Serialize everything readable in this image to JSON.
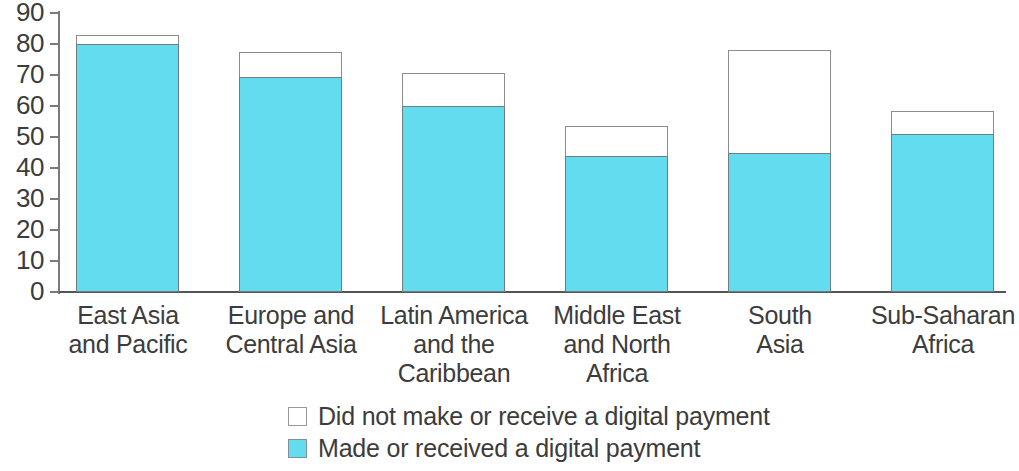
{
  "chart_data": {
    "type": "bar",
    "title": "",
    "subtitle": "",
    "xlabel": "",
    "ylabel": "",
    "ylim": [
      0,
      90
    ],
    "ytick_labels": [
      "90",
      "80",
      "70",
      "60",
      "50",
      "40",
      "30",
      "20",
      "10",
      "0"
    ],
    "yticks": [
      90,
      80,
      70,
      60,
      50,
      40,
      30,
      20,
      10,
      0
    ],
    "grid": false,
    "stacked": true,
    "legend_position": "bottom-center",
    "categories": [
      "East Asia and Pacific",
      "Europe and Central Asia",
      "Latin America and the Caribbean",
      "Middle East and North Africa",
      "South Asia",
      "Sub-Saharan Africa"
    ],
    "category_lines": [
      [
        "East Asia",
        "and Pacific"
      ],
      [
        "Europe and",
        "Central Asia"
      ],
      [
        "Latin America",
        "and the",
        "Caribbean"
      ],
      [
        "Middle East",
        "and North",
        "Africa"
      ],
      [
        "South",
        "Asia"
      ],
      [
        "Sub-Saharan",
        "Africa"
      ]
    ],
    "series": [
      {
        "name": "Made or received a digital payment",
        "color": "#62dcee",
        "values": [
          80,
          69.5,
          60,
          44,
          45,
          51
        ]
      },
      {
        "name": "Did not make or receive a digital payment",
        "color": "#ffffff",
        "values": [
          3,
          8,
          10.5,
          9.5,
          33,
          7.5
        ]
      }
    ],
    "totals": [
      83,
      77.5,
      70.5,
      53.5,
      78,
      58.5
    ]
  },
  "legend": {
    "items": [
      {
        "label": "Did not make or receive a digital payment",
        "swatch": "white-square-icon"
      },
      {
        "label": "Made or received a digital payment",
        "swatch": "cyan-square-icon"
      }
    ]
  }
}
